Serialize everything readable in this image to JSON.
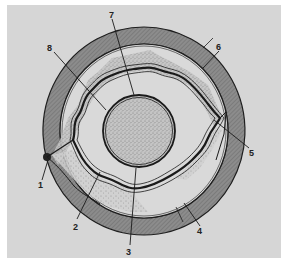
{
  "diagram": {
    "type": "cross-section schematic",
    "colors": {
      "background": "#d6d6d6",
      "outer_ring": "#8a8a8a",
      "line": "#1e1e1e",
      "stipple": "#9a9a9a",
      "nucleus_fill": "#c8c8c8"
    },
    "labels": [
      {
        "id": "1",
        "text": "1"
      },
      {
        "id": "2",
        "text": "2"
      },
      {
        "id": "3",
        "text": "3"
      },
      {
        "id": "4",
        "text": "4"
      },
      {
        "id": "5",
        "text": "5"
      },
      {
        "id": "6",
        "text": "6"
      },
      {
        "id": "7",
        "text": "7"
      },
      {
        "id": "8",
        "text": "8"
      }
    ]
  }
}
